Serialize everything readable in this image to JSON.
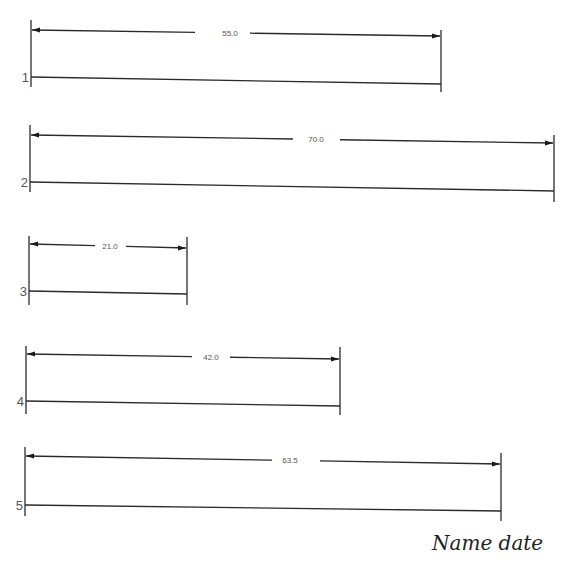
{
  "worksheet": {
    "rows": [
      {
        "number": "1",
        "dimension": "55.0"
      },
      {
        "number": "2",
        "dimension": "70.0"
      },
      {
        "number": "3",
        "dimension": "21.0"
      },
      {
        "number": "4",
        "dimension": "42.0"
      },
      {
        "number": "5",
        "dimension": "63.5"
      }
    ],
    "signature": "Name date"
  }
}
